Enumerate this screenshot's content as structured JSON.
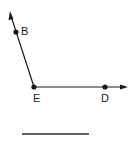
{
  "diagram": {
    "type": "geometry-angle",
    "points": {
      "B": {
        "label": "B",
        "x": 16,
        "y": 32
      },
      "E": {
        "label": "E",
        "x": 34,
        "y": 87
      },
      "D": {
        "label": "D",
        "x": 105,
        "y": 87
      }
    },
    "rays": [
      {
        "name": "ray-EB",
        "from": "E",
        "through": "B",
        "arrow_tip": {
          "x": 10,
          "y": 12
        }
      },
      {
        "name": "ray-ED",
        "from": "E",
        "through": "D",
        "arrow_tip": {
          "x": 128,
          "y": 87
        }
      }
    ],
    "answer_line": {
      "x1": 22,
      "y1": 134,
      "x2": 89,
      "y2": 134
    },
    "colors": {
      "stroke": "#1a1a1a",
      "background": "#ffffff"
    }
  }
}
